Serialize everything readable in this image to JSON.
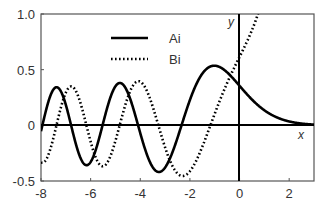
{
  "chart_data": {
    "type": "line",
    "title": "",
    "xlabel": "x",
    "ylabel": "y",
    "xlim": [
      -8,
      3
    ],
    "ylim": [
      -0.5,
      1.0
    ],
    "xticks": [
      "-8",
      "-6",
      "-4",
      "-2",
      "0",
      "2"
    ],
    "yticks": [
      "-0.5",
      "0",
      "0.5",
      "1.0"
    ],
    "grid": false,
    "legend_position": "upper-middle",
    "series": [
      {
        "name": "Ai",
        "style": "solid",
        "x": [
          -8,
          -7.4,
          -6.8,
          -6.2,
          -5.5,
          -4.8,
          -4.2,
          -3.3,
          -2.3,
          -1.0,
          0,
          1,
          2,
          3
        ],
        "values": [
          -0.05,
          0.33,
          0.05,
          -0.35,
          0.05,
          0.38,
          0.08,
          -0.42,
          0.0,
          0.54,
          0.36,
          0.14,
          0.03,
          0.01
        ]
      },
      {
        "name": "Bi",
        "style": "dotted",
        "x": [
          -8,
          -7,
          -6.4,
          -5.5,
          -4.8,
          -3.9,
          -3.0,
          -2.0,
          -1.2,
          0,
          0.7
        ],
        "values": [
          -0.33,
          0.32,
          0.0,
          -0.37,
          0.0,
          0.39,
          0.05,
          -0.45,
          0.0,
          0.61,
          1.0
        ]
      }
    ]
  }
}
